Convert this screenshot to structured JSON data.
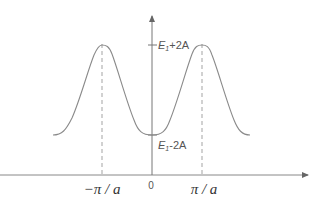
{
  "diagram": {
    "type": "energy-band",
    "y_labels": {
      "max": "E",
      "max_sub": "1",
      "max_suffix": "+2A",
      "min": "E",
      "min_sub": "1",
      "min_suffix": "-2A"
    },
    "x_labels": {
      "left": "−π / a",
      "origin": "0",
      "right": "π / a"
    },
    "colors": {
      "curve": "#8a8a8a",
      "axis": "#777777",
      "dashed": "#999999",
      "text": "#555555"
    }
  }
}
